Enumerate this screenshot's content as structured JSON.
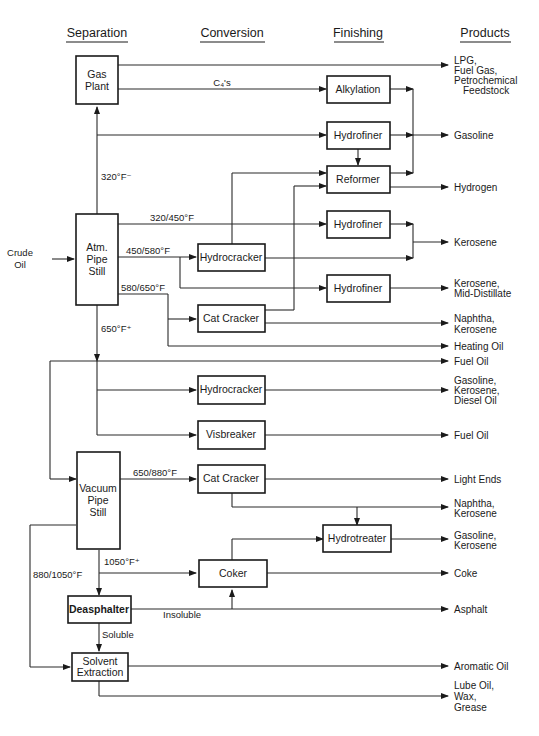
{
  "headers": {
    "separation": "Separation",
    "conversion": "Conversion",
    "finishing": "Finishing",
    "products": "Products"
  },
  "input": {
    "line1": "Crude",
    "line2": "Oil"
  },
  "units": {
    "gas_plant": [
      "Gas",
      "Plant"
    ],
    "atm_pipe_still": [
      "Atm.",
      "Pipe",
      "Still"
    ],
    "vacuum_pipe_still": [
      "Vacuum",
      "Pipe",
      "Still"
    ],
    "deasphalter": "Deasphalter",
    "solvent_extraction": [
      "Solvent",
      "Extraction"
    ],
    "hydrocracker_1": "Hydrocracker",
    "cat_cracker_1": "Cat  Cracker",
    "hydrocracker_2": "Hydrocracker",
    "visbreaker": "Visbreaker",
    "cat_cracker_2": "Cat  Cracker",
    "coker": "Coker",
    "alkylation": "Alkylation",
    "hydrofiner_1": "Hydrofiner",
    "reformer": "Reformer",
    "hydrofiner_2": "Hydrofiner",
    "hydrofiner_3": "Hydrofiner",
    "hydrotreater": "Hydrotreater"
  },
  "stream_labels": {
    "c4s": "C₄'s",
    "cut_320_minus": "320°F⁻",
    "cut_320_450": "320/450°F",
    "cut_450_580": "450/580°F",
    "cut_580_650": "580/650°F",
    "cut_650_plus": "650°F⁺",
    "cut_650_880": "650/880°F",
    "cut_880_1050": "880/1050°F",
    "cut_1050_plus": "1050°F⁺",
    "insoluble": "Insoluble",
    "soluble": "Soluble"
  },
  "products": {
    "lpg": [
      "LPG,",
      "Fuel  Gas,",
      "Petrochemical",
      "Feedstock"
    ],
    "gasoline": [
      "Gasoline"
    ],
    "hydrogen": [
      "Hydrogen"
    ],
    "kerosene": [
      "Kerosene"
    ],
    "kerosene_mid": [
      "Kerosene,",
      "Mid-Distillate"
    ],
    "naphtha_kero_1": [
      "Naphtha,",
      "Kerosene"
    ],
    "heating_oil": [
      "Heating  Oil"
    ],
    "fuel_oil_1": [
      "Fuel  Oil"
    ],
    "gas_kero_diesel": [
      "Gasoline,",
      "Kerosene,",
      "Diesel Oil"
    ],
    "fuel_oil_2": [
      "Fuel  Oil"
    ],
    "light_ends": [
      "Light  Ends"
    ],
    "naphtha_kero_2": [
      "Naphtha,",
      "Kerosene"
    ],
    "gas_kero": [
      "Gasoline,",
      "Kerosene"
    ],
    "coke": [
      "Coke"
    ],
    "asphalt": [
      "Asphalt"
    ],
    "aromatic_oil": [
      "Aromatic  Oil"
    ],
    "lube": [
      "Lube  Oil,",
      "Wax,",
      "Grease"
    ]
  }
}
